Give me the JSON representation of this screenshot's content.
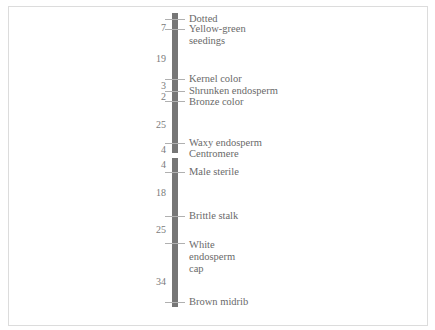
{
  "diagram": {
    "type": "genetic-linkage-map",
    "colors": {
      "chromosome": "#767676",
      "text": "#6a6a6a",
      "frame": "#dcdcdc"
    },
    "loci": [
      {
        "id": "dotted",
        "label": "Dotted"
      },
      {
        "id": "yellow-green-seedings",
        "label": "Yellow-green\nseedings"
      },
      {
        "id": "kernel-color",
        "label": "Kernel color"
      },
      {
        "id": "shrunken-endosperm",
        "label": "Shrunken endosperm"
      },
      {
        "id": "bronze-color",
        "label": "Bronze color"
      },
      {
        "id": "waxy-endosperm",
        "label": "Waxy endosperm"
      },
      {
        "id": "centromere",
        "label": "Centromere"
      },
      {
        "id": "male-sterile",
        "label": "Male sterile"
      },
      {
        "id": "brittle-stalk",
        "label": "Brittle stalk"
      },
      {
        "id": "white-endosperm-cap",
        "label": "White\nendosperm\ncap"
      },
      {
        "id": "brown-midrib",
        "label": "Brown midrib"
      }
    ],
    "distances": [
      {
        "between": [
          "dotted",
          "yellow-green-seedings"
        ],
        "value": "7"
      },
      {
        "between": [
          "yellow-green-seedings",
          "kernel-color"
        ],
        "value": "19"
      },
      {
        "between": [
          "kernel-color",
          "shrunken-endosperm"
        ],
        "value": "3"
      },
      {
        "between": [
          "shrunken-endosperm",
          "bronze-color"
        ],
        "value": "2"
      },
      {
        "between": [
          "bronze-color",
          "waxy-endosperm"
        ],
        "value": "25"
      },
      {
        "between": [
          "waxy-endosperm",
          "centromere"
        ],
        "value": "4"
      },
      {
        "between": [
          "centromere",
          "male-sterile"
        ],
        "value": "4"
      },
      {
        "between": [
          "male-sterile",
          "brittle-stalk"
        ],
        "value": "18"
      },
      {
        "between": [
          "brittle-stalk",
          "white-endosperm-cap"
        ],
        "value": "25"
      },
      {
        "between": [
          "white-endosperm-cap",
          "brown-midrib"
        ],
        "value": "34"
      }
    ]
  }
}
